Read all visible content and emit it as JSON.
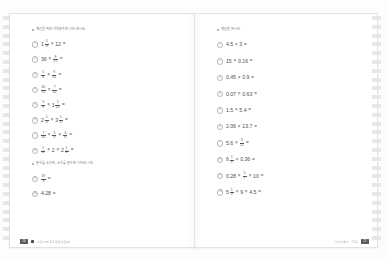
{
  "document": {
    "type": "scanned-workbook-spread",
    "binding": "spiral",
    "hole_count": 26
  },
  "left_page": {
    "sections": [
      {
        "heading": "계산을 하여 기약분수로 나타내시오.",
        "problems": [
          {
            "marker": "1",
            "parts": [
              {
                "t": "mixed",
                "whole": "1",
                "n": "5",
                "d": "8"
              },
              {
                "t": "op",
                "v": "×"
              },
              {
                "t": "num",
                "v": "12"
              },
              {
                "t": "op",
                "v": "="
              }
            ]
          },
          {
            "marker": "2",
            "parts": [
              {
                "t": "num",
                "v": "36"
              },
              {
                "t": "op",
                "v": "×"
              },
              {
                "t": "frac",
                "n": "8",
                "d": "27"
              },
              {
                "t": "op",
                "v": "="
              }
            ]
          },
          {
            "marker": "3",
            "parts": [
              {
                "t": "frac",
                "n": "5",
                "d": "6"
              },
              {
                "t": "op",
                "v": "×"
              },
              {
                "t": "frac",
                "n": "9",
                "d": "20"
              },
              {
                "t": "op",
                "v": "="
              }
            ]
          },
          {
            "marker": "4",
            "parts": [
              {
                "t": "frac",
                "n": "20",
                "d": "21"
              },
              {
                "t": "op",
                "v": "×"
              },
              {
                "t": "frac",
                "n": "7",
                "d": "12"
              },
              {
                "t": "op",
                "v": "="
              }
            ]
          },
          {
            "marker": "5",
            "parts": [
              {
                "t": "frac",
                "n": "5",
                "d": "8"
              },
              {
                "t": "op",
                "v": "×"
              },
              {
                "t": "mixed",
                "whole": "1",
                "n": "1",
                "d": "15"
              },
              {
                "t": "op",
                "v": "="
              }
            ]
          },
          {
            "marker": "6",
            "parts": [
              {
                "t": "mixed",
                "whole": "2",
                "n": "1",
                "d": "4"
              },
              {
                "t": "op",
                "v": "×"
              },
              {
                "t": "mixed",
                "whole": "3",
                "n": "1",
                "d": "3"
              },
              {
                "t": "op",
                "v": "="
              }
            ]
          },
          {
            "marker": "7",
            "parts": [
              {
                "t": "frac",
                "n": "7",
                "d": "10"
              },
              {
                "t": "op",
                "v": "×"
              },
              {
                "t": "frac",
                "n": "5",
                "d": "6"
              },
              {
                "t": "op",
                "v": "×"
              },
              {
                "t": "frac",
                "n": "3",
                "d": "8"
              },
              {
                "t": "op",
                "v": "="
              }
            ]
          },
          {
            "marker": "8",
            "parts": [
              {
                "t": "frac",
                "n": "1",
                "d": "4"
              },
              {
                "t": "op",
                "v": "×"
              },
              {
                "t": "num",
                "v": "2"
              },
              {
                "t": "op",
                "v": "×"
              },
              {
                "t": "mixed",
                "whole": "2",
                "n": "1",
                "d": "2"
              },
              {
                "t": "op",
                "v": "="
              }
            ]
          }
        ]
      },
      {
        "heading": "분수를 소수로, 소수를 분수로 나타내시오.",
        "problems": [
          {
            "marker": "9",
            "parts": [
              {
                "t": "frac",
                "n": "19",
                "d": "8"
              },
              {
                "t": "op",
                "v": "="
              }
            ]
          },
          {
            "marker": "10",
            "parts": [
              {
                "t": "num",
                "v": "4.28"
              },
              {
                "t": "op",
                "v": "="
              }
            ]
          }
        ]
      }
    ],
    "footer": {
      "page_number": "26",
      "brand_text": "초등수학 6-1 쌍둥이 문제",
      "has_brandmark": true
    }
  },
  "right_page": {
    "sections": [
      {
        "heading": "계산을 하시오.",
        "problems": [
          {
            "marker": "1",
            "parts": [
              {
                "t": "num",
                "v": "4.5"
              },
              {
                "t": "op",
                "v": "×"
              },
              {
                "t": "num",
                "v": "3"
              },
              {
                "t": "op",
                "v": "="
              }
            ]
          },
          {
            "marker": "2",
            "parts": [
              {
                "t": "num",
                "v": "15"
              },
              {
                "t": "op",
                "v": "×"
              },
              {
                "t": "num",
                "v": "0.16"
              },
              {
                "t": "op",
                "v": "="
              }
            ]
          },
          {
            "marker": "3",
            "parts": [
              {
                "t": "num",
                "v": "0.45"
              },
              {
                "t": "op",
                "v": "×"
              },
              {
                "t": "num",
                "v": "0.9"
              },
              {
                "t": "op",
                "v": "="
              }
            ]
          },
          {
            "marker": "4",
            "parts": [
              {
                "t": "num",
                "v": "0.07"
              },
              {
                "t": "op",
                "v": "×"
              },
              {
                "t": "num",
                "v": "0.63"
              },
              {
                "t": "op",
                "v": "="
              }
            ]
          },
          {
            "marker": "5",
            "parts": [
              {
                "t": "num",
                "v": "1.5"
              },
              {
                "t": "op",
                "v": "×"
              },
              {
                "t": "num",
                "v": "5.4"
              },
              {
                "t": "op",
                "v": "="
              }
            ]
          },
          {
            "marker": "6",
            "parts": [
              {
                "t": "num",
                "v": "2.06"
              },
              {
                "t": "op",
                "v": "×"
              },
              {
                "t": "num",
                "v": "13.7"
              },
              {
                "t": "op",
                "v": "="
              }
            ]
          },
          {
            "marker": "7",
            "parts": [
              {
                "t": "num",
                "v": "5.6"
              },
              {
                "t": "op",
                "v": "×"
              },
              {
                "t": "frac",
                "n": "5",
                "d": "12"
              },
              {
                "t": "op",
                "v": "="
              }
            ]
          },
          {
            "marker": "8",
            "parts": [
              {
                "t": "mixed",
                "whole": "6",
                "n": "1",
                "d": "4"
              },
              {
                "t": "op",
                "v": "×"
              },
              {
                "t": "num",
                "v": "0.36"
              },
              {
                "t": "op",
                "v": "="
              }
            ]
          },
          {
            "marker": "9",
            "parts": [
              {
                "t": "num",
                "v": "0.28"
              },
              {
                "t": "op",
                "v": "×"
              },
              {
                "t": "frac",
                "n": "5",
                "d": "7"
              },
              {
                "t": "op",
                "v": "×"
              },
              {
                "t": "num",
                "v": "10"
              },
              {
                "t": "op",
                "v": "="
              }
            ]
          },
          {
            "marker": "10",
            "parts": [
              {
                "t": "mixed",
                "whole": "5",
                "n": "1",
                "d": "3"
              },
              {
                "t": "op",
                "v": "×"
              },
              {
                "t": "num",
                "v": "9"
              },
              {
                "t": "op",
                "v": "×"
              },
              {
                "t": "num",
                "v": "4.5"
              },
              {
                "t": "op",
                "v": "="
              }
            ]
          }
        ]
      }
    ],
    "footer": {
      "page_number": "27",
      "brand_text": "정답과 풀이 · 15쪽",
      "has_brandmark": false
    }
  },
  "colors": {
    "paper": "#ffffff",
    "page_border": "#e2e2e4",
    "ink": "#4e4e53",
    "heading_ink": "#6b6b70",
    "hole": "#e6e7ea",
    "pageno_bg": "#5a5a60"
  }
}
